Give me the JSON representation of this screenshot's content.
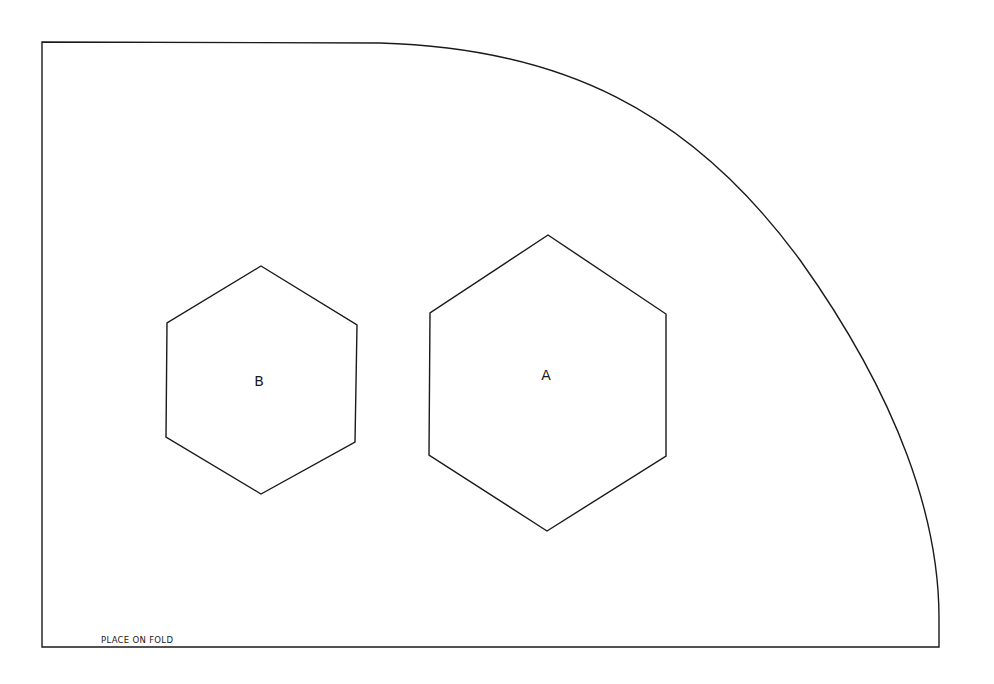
{
  "pattern": {
    "stroke_color": "#1a1a1a",
    "background": "#ffffff",
    "outline": {
      "name": "pattern-outline",
      "path": "M 42 42 L 380 43 C 560 48 690 110 800 260 C 900 400 939 520 939 618 L 939 647 L 42 647 Z"
    },
    "pieces": [
      {
        "id": "B",
        "label": "B",
        "points": "261,266 357,325 355,442 261,494 166,437 167,323",
        "label_x": 259,
        "label_y": 381
      },
      {
        "id": "A",
        "label": "A",
        "points": "548,235 666,314 666,456 547,531 429,455 430,313",
        "label_x": 546,
        "label_y": 375
      }
    ],
    "fold_note": {
      "text": "PLACE ON FOLD",
      "x": 101,
      "y": 635
    }
  }
}
